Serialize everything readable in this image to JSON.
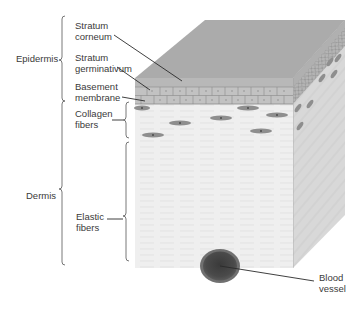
{
  "diagram": {
    "colors": {
      "top_face": "#a9a9a9",
      "epidermis_band": "#b9b9b9",
      "cell_layer": "#c4c4c4",
      "dermis_front": "#eeeeee",
      "dermis_right": "#d6d6d6",
      "fibroblast": "#8a8a8a",
      "vessel_outer": "#6f6f6f",
      "vessel_inner": "#3f3f3f",
      "label_text": "#3a3a3a",
      "leader_line": "#2a2a2a"
    },
    "groups": [
      {
        "id": "epidermis",
        "label": "Epidermis"
      },
      {
        "id": "dermis",
        "label": "Dermis"
      }
    ],
    "labels": {
      "stratum_corneum": [
        "Stratum",
        "corneum"
      ],
      "stratum_germinativum": [
        "Stratum",
        "germinativum"
      ],
      "basement_membrane": [
        "Basement",
        "membrane"
      ],
      "collagen_fibers": [
        "Collagen",
        "fibers"
      ],
      "elastic_fibers": [
        "Elastic",
        "fibers"
      ],
      "blood_vessel": [
        "Blood",
        "vessel"
      ]
    }
  }
}
